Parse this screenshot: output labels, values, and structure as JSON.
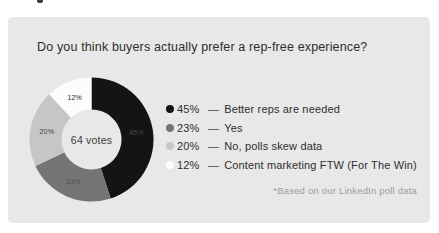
{
  "card": {
    "background": "#e9e8e8"
  },
  "chart_data": {
    "type": "pie",
    "subtype": "donut",
    "title": "Do you think buyers actually prefer a rep-free experience?",
    "center_label": "64 votes",
    "unit": "%",
    "categories": [
      "Better reps are needed",
      "Yes",
      "No, polls skew data",
      "Content marketing FTW (For The Win)"
    ],
    "values": [
      45,
      23,
      20,
      12
    ],
    "colors": [
      "#141414",
      "#757575",
      "#c6c6c6",
      "#fcfcfc"
    ],
    "slice_label_colors": [
      "#4a4a4a",
      "#515151",
      "#3a3a3a",
      "#262626"
    ],
    "separator": "—",
    "legend_position": "right",
    "start_angle_deg": 0,
    "direction": "clockwise",
    "footnote": "*Based on our LinkedIn poll data"
  }
}
